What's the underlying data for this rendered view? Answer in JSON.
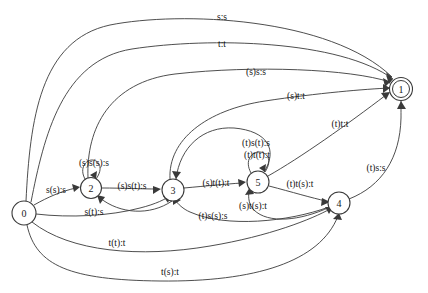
{
  "diagram": {
    "type": "finite-state-transducer",
    "title": "",
    "background_color": "#ffffff",
    "stroke_color": "#3a3a3a",
    "text_color": "#141414",
    "states": [
      {
        "id": "0",
        "label": "0",
        "x": 24,
        "y": 213,
        "r": 12,
        "accepting": false,
        "start": true
      },
      {
        "id": "1",
        "label": "1",
        "x": 401,
        "y": 89,
        "r": 11.5,
        "accepting": true,
        "start": false
      },
      {
        "id": "2",
        "label": "2",
        "x": 91,
        "y": 188,
        "r": 10.5,
        "accepting": false,
        "start": false
      },
      {
        "id": "3",
        "label": "3",
        "x": 173,
        "y": 190,
        "r": 11,
        "accepting": false,
        "start": false
      },
      {
        "id": "4",
        "label": "4",
        "x": 339,
        "y": 203,
        "r": 11,
        "accepting": false,
        "start": false
      },
      {
        "id": "5",
        "label": "5",
        "x": 258,
        "y": 182,
        "r": 11,
        "accepting": false,
        "start": false
      }
    ],
    "transitions": [
      {
        "from": "0",
        "to": "1",
        "label": "s:s",
        "label_x": 222,
        "label_y": 17
      },
      {
        "from": "0",
        "to": "1",
        "label": "t:t",
        "label_x": 222,
        "label_y": 44
      },
      {
        "from": "2",
        "to": "1",
        "label": "(s)s:s",
        "label_x": 256,
        "label_y": 72
      },
      {
        "from": "3",
        "to": "1",
        "label": "(s)t:t",
        "label_x": 296,
        "label_y": 96
      },
      {
        "from": "5",
        "to": "1",
        "label": "(t)t:t",
        "label_x": 340,
        "label_y": 124
      },
      {
        "from": "4",
        "to": "1",
        "label": "(t)s:s",
        "label_x": 376,
        "label_y": 168
      },
      {
        "from": "5",
        "to": "3",
        "label": "(t)s(t):s",
        "label_x": 256,
        "label_y": 143
      },
      {
        "from": "5",
        "to": "5",
        "label": "(t)t(t):t",
        "label_x": 257,
        "label_y": 155
      },
      {
        "from": "2",
        "to": "2",
        "label": "(s)s(s):s",
        "label_x": 94,
        "label_y": 163
      },
      {
        "from": "0",
        "to": "2",
        "label": "s(s):s",
        "label_x": 56,
        "label_y": 190
      },
      {
        "from": "2",
        "to": "3",
        "label": "(s)s(t):s",
        "label_x": 132,
        "label_y": 186
      },
      {
        "from": "3",
        "to": "5",
        "label": "(s)t(t):t",
        "label_x": 216,
        "label_y": 183
      },
      {
        "from": "5",
        "to": "4",
        "label": "(t)t(s):t",
        "label_x": 300,
        "label_y": 184
      },
      {
        "from": "0",
        "to": "2",
        "label": "s(t):s",
        "label_x": 94,
        "label_y": 212
      },
      {
        "from": "4",
        "to": "5",
        "label": "(s)t(s):t",
        "label_x": 253,
        "label_y": 206
      },
      {
        "from": "4",
        "to": "3",
        "label": "(t)s(s):s",
        "label_x": 213,
        "label_y": 216
      },
      {
        "from": "0",
        "to": "4",
        "label": "t(t):t",
        "label_x": 117,
        "label_y": 243
      },
      {
        "from": "0",
        "to": "4",
        "label": "t(s):t",
        "label_x": 170,
        "label_y": 272
      }
    ]
  }
}
